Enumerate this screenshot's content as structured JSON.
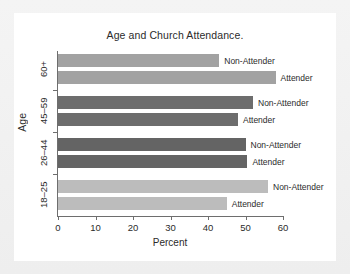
{
  "chart_data": {
    "type": "bar",
    "orientation": "horizontal",
    "title": "Age and Church Attendance.",
    "xlabel": "Percent",
    "ylabel": "Age",
    "xlim": [
      0,
      60
    ],
    "xticks": [
      0,
      10,
      20,
      30,
      40,
      50,
      60
    ],
    "grid": false,
    "legend": "none",
    "categories": [
      "18–25",
      "26–44",
      "45–59",
      "60+"
    ],
    "series": [
      {
        "name": "Attender",
        "values": [
          45,
          50.5,
          48,
          58
        ]
      },
      {
        "name": "Non-Attender",
        "values": [
          56,
          50,
          52,
          43
        ]
      }
    ],
    "groups": [
      {
        "category": "60+",
        "color": "#a2a2a2",
        "bars": [
          {
            "label": "Non-Attender",
            "value": 43
          },
          {
            "label": "Attender",
            "value": 58
          }
        ]
      },
      {
        "category": "45–59",
        "color": "#6d6d6d",
        "bars": [
          {
            "label": "Non-Attender",
            "value": 52
          },
          {
            "label": "Attender",
            "value": 48
          }
        ]
      },
      {
        "category": "26–44",
        "color": "#646464",
        "bars": [
          {
            "label": "Non-Attender",
            "value": 50
          },
          {
            "label": "Attender",
            "value": 50.5
          }
        ]
      },
      {
        "category": "18–25",
        "color": "#bcbcbc",
        "bars": [
          {
            "label": "Non-Attender",
            "value": 56
          },
          {
            "label": "Attender",
            "value": 45
          }
        ]
      }
    ]
  }
}
